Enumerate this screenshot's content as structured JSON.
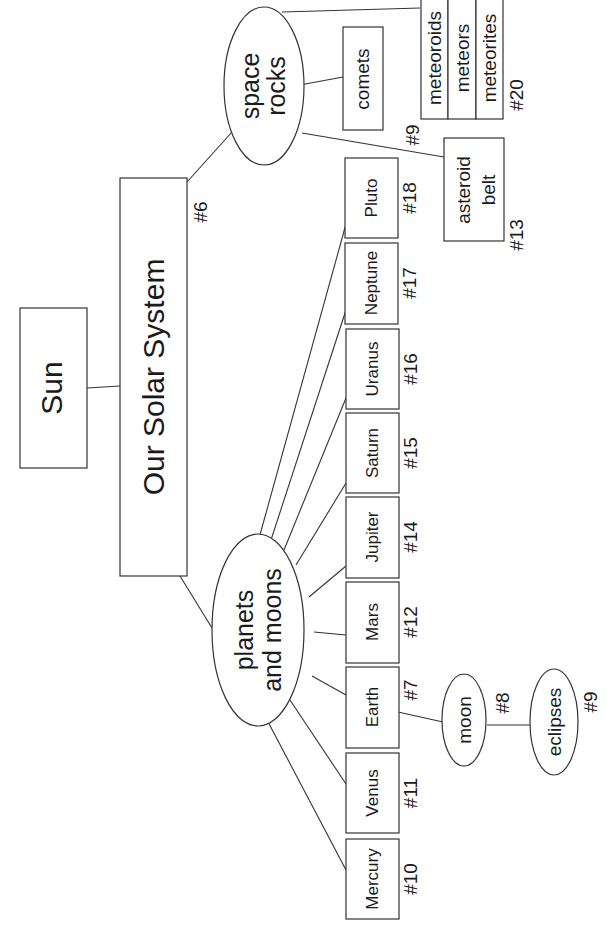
{
  "diagram": {
    "orientation": "rotated -90deg",
    "colors": {
      "stroke": "#333333",
      "text": "#1a1a1a",
      "background": "#ffffff"
    },
    "nodes": {
      "sun": {
        "label": "Sun"
      },
      "solar_system": {
        "label": "Our Solar System",
        "number": "#6"
      },
      "space_rocks": {
        "label_line1": "space",
        "label_line2": "rocks"
      },
      "planets_moons": {
        "label_line1": "planets",
        "label_line2": "and moons"
      },
      "comets": {
        "label": "comets"
      },
      "meteor_group": {
        "items": [
          "meteoroids",
          "meteors",
          "meteorites"
        ],
        "number": "#20"
      },
      "asteroid_belt": {
        "label_line1": "asteroid",
        "label_line2": "belt",
        "number": "#13"
      },
      "space_rocks_number": "#9",
      "planets": [
        {
          "label": "Pluto",
          "number": "#18"
        },
        {
          "label": "Neptune",
          "number": "#17"
        },
        {
          "label": "Uranus",
          "number": "#16"
        },
        {
          "label": "Saturn",
          "number": "#15"
        },
        {
          "label": "Jupiter",
          "number": "#14"
        },
        {
          "label": "Mars",
          "number": "#12"
        },
        {
          "label": "Earth",
          "number": "#7"
        },
        {
          "label": "Venus",
          "number": "#11"
        },
        {
          "label": "Mercury",
          "number": "#10"
        }
      ],
      "moon": {
        "label": "moon",
        "number": "#8"
      },
      "eclipses": {
        "label": "eclipses",
        "number": "#9"
      }
    }
  }
}
